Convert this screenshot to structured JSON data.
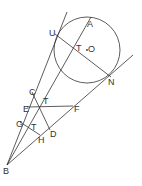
{
  "diagram": {
    "circle": {
      "cx": 87,
      "cy": 50,
      "r": 33,
      "center_label": "O"
    },
    "points": {
      "A": [
        90,
        18
      ],
      "U": [
        55,
        34
      ],
      "N": [
        111,
        77
      ],
      "T1": [
        75,
        46
      ],
      "C": [
        32,
        92
      ],
      "E": [
        27,
        107
      ],
      "T2": [
        40,
        106
      ],
      "F": [
        73,
        106
      ],
      "G": [
        20,
        122
      ],
      "T3": [
        33,
        124
      ],
      "D": [
        50,
        130
      ],
      "H": [
        40,
        135
      ],
      "B": [
        7,
        165
      ]
    },
    "labels": {
      "A": "A",
      "U": "U",
      "T1": "T",
      "O": "O",
      "N": "N",
      "C": "C",
      "T2": "T",
      "E": "E",
      "F": "F",
      "G": "G",
      "T3": "T",
      "D": "D",
      "H": "H",
      "B": "B"
    }
  }
}
